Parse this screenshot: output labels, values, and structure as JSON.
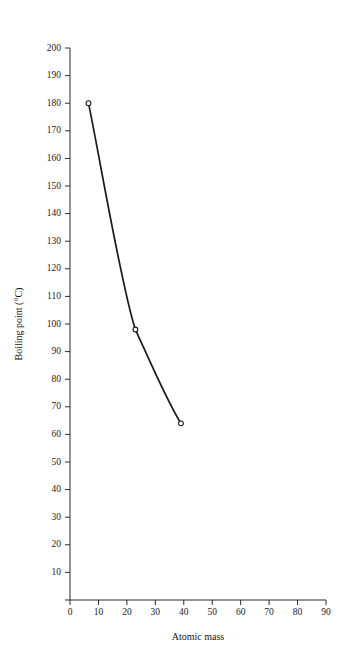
{
  "chart_data": {
    "type": "line",
    "title": "",
    "xlabel": "Atomic mass",
    "ylabel": "Boiling point (°C)",
    "xlim": [
      0,
      90
    ],
    "ylim": [
      0,
      200
    ],
    "grid": false,
    "legend": "none",
    "marker": "open-circle",
    "line_color": "#1b1b1b",
    "x": [
      6.5,
      23,
      39
    ],
    "values": [
      180,
      98,
      64
    ],
    "points": [
      {
        "x": 6.5,
        "y": 180
      },
      {
        "x": 23,
        "y": 98
      },
      {
        "x": 39,
        "y": 64
      }
    ],
    "xticks": [
      0,
      10,
      20,
      30,
      40,
      50,
      60,
      70,
      80,
      90
    ],
    "xtick_labels": [
      "0",
      "10",
      "20",
      "30",
      "40",
      "50",
      "60",
      "70",
      "80",
      "90"
    ],
    "yticks": [
      10,
      20,
      30,
      40,
      50,
      60,
      70,
      80,
      90,
      100,
      110,
      120,
      130,
      140,
      150,
      160,
      170,
      180,
      190,
      200
    ],
    "ytick_labels": [
      "10",
      "20",
      "30",
      "40",
      "50",
      "60",
      "70",
      "80",
      "90",
      "100",
      "110",
      "120",
      "130",
      "140",
      "150",
      "160",
      "170",
      "180",
      "190",
      "200"
    ]
  },
  "axes": {
    "y_axis_title": "Boiling point (°C)",
    "x_axis_title": "Atomic mass"
  }
}
